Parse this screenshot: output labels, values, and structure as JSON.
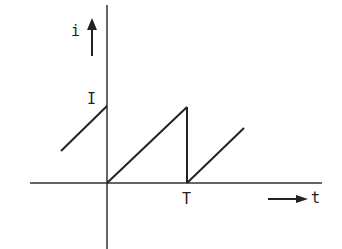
{
  "diagram": {
    "type": "sawtooth current waveform",
    "labels": {
      "y_axis": "i",
      "peak": "I",
      "period": "T",
      "x_axis": "t"
    },
    "colors": {
      "ink": "#222222",
      "background": "#ffffff"
    }
  }
}
